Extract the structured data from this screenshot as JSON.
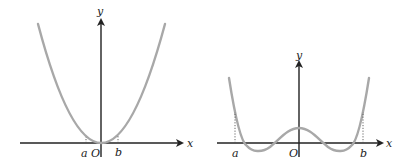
{
  "figures": [
    {
      "id": "left",
      "description": "Parabola y = kx^2 with vertex at origin",
      "axis_labels": {
        "x": "x",
        "y": "y"
      },
      "origin_label": "O",
      "point_labels": [
        "a",
        "b"
      ]
    },
    {
      "id": "right",
      "description": "Even quartic-like curve with central hump and two minima below x-axis",
      "axis_labels": {
        "x": "x",
        "y": "y"
      },
      "origin_label": "O",
      "point_labels": [
        "a",
        "b"
      ]
    }
  ],
  "colors": {
    "axis": "#222222",
    "curve": "#a8a8a8"
  }
}
